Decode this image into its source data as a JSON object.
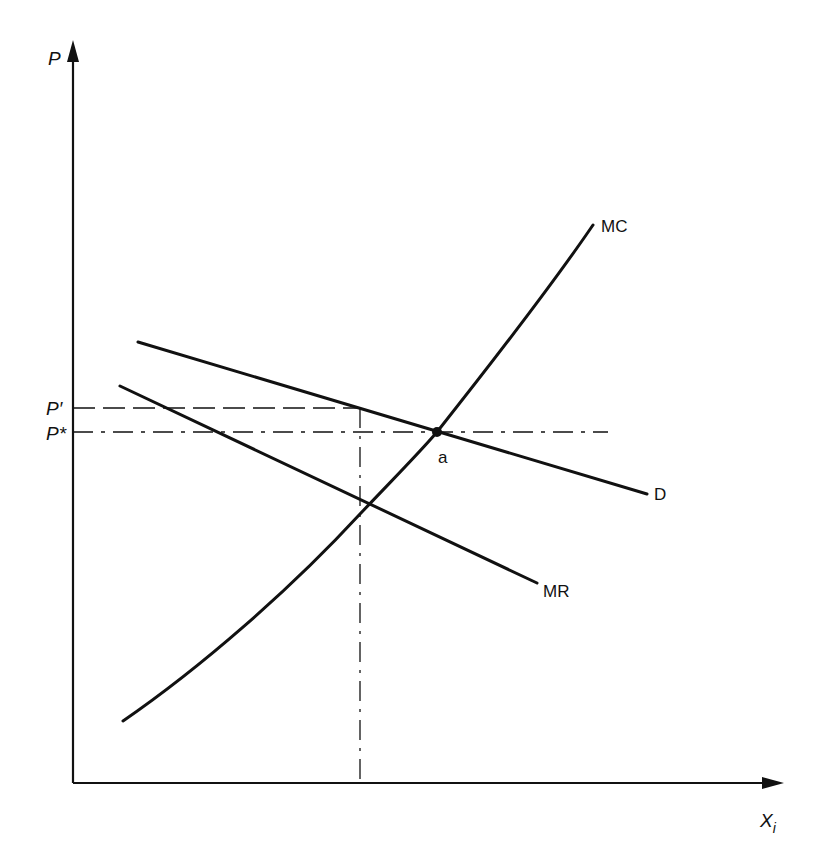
{
  "diagram": {
    "type": "economics-supply-demand",
    "colors": {
      "ink": "#111111",
      "background": "#ffffff"
    },
    "axes": {
      "y_label": "P",
      "x_label": "X",
      "x_label_subscript": "i"
    },
    "price_levels": {
      "p_prime": "P′",
      "p_star": "P*"
    },
    "curves": {
      "mc": "MC",
      "d": "D",
      "mr": "MR"
    },
    "points": {
      "a": "a"
    }
  }
}
